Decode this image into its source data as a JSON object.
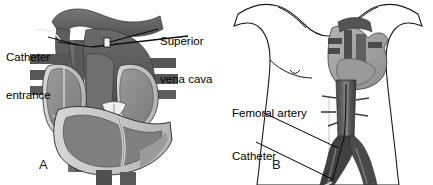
{
  "figure": {
    "background_color": "#ffffff",
    "ink_color": "#000000",
    "panel_count": 2
  },
  "panel_a": {
    "letter": "A",
    "description": "Cut-away anterior view of the heart with catheter entering through the superior vena cava",
    "labels": {
      "catheter_entrance_line1": "Catheter",
      "catheter_entrance_line2": "entrance",
      "superior_vena_cava_line1": "Superior",
      "superior_vena_cava_line2": "vena cava"
    },
    "anatomy": [
      "aortic arch",
      "superior vena cava",
      "pulmonary artery",
      "right atrium",
      "left atrium",
      "right ventricle",
      "left ventricle",
      "myocardium",
      "aortic valve",
      "inferior vena cava",
      "catheter"
    ],
    "colors": {
      "vessel_dark": "#5d5d5d",
      "vessel_darker": "#4a4a4a",
      "chamber_mid": "#8a8a8a",
      "myocardium_light": "#c9c9c9",
      "highlight": "#e8e8e8",
      "outline": "#2b2b2b"
    }
  },
  "panel_b": {
    "letter": "B",
    "description": "Torso outline showing catheter path from femoral artery through the aorta to the heart",
    "labels": {
      "femoral_artery": "Femoral artery",
      "catheter_entrance_line1": "Catheter",
      "catheter_entrance_line2": "entrance"
    },
    "anatomy": [
      "torso outline",
      "shoulders",
      "nipples",
      "heart",
      "descending aorta",
      "abdominal aorta",
      "aortic bifurcation",
      "common iliac arteries",
      "femoral artery",
      "catheter"
    ],
    "colors": {
      "body_outline": "#1a1a1a",
      "vessel_dark": "#3f3f3f",
      "vessel_mid": "#6e6e6e",
      "heart_light": "#b9b9b9",
      "skin_fill": "#ffffff"
    }
  }
}
